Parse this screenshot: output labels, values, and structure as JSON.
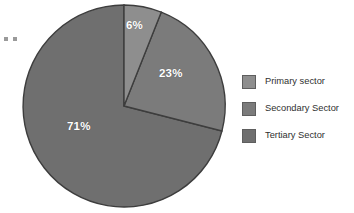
{
  "chart_data": {
    "type": "pie",
    "title": "",
    "categories": [
      "Primary sector",
      "Secondary Sector",
      "Tertiary Sector"
    ],
    "values": [
      6,
      23,
      71
    ],
    "value_unit": "%",
    "data_labels": [
      "6%",
      "23%",
      "71%"
    ],
    "colors": [
      "#8e8e8e",
      "#7b7b7b",
      "#6f6f6f"
    ],
    "slice_border_color": "#3d3d3d",
    "label_color": "#ffffff",
    "start_angle_deg": 0,
    "direction": "clockwise",
    "legend_position": "right",
    "grid": false,
    "background": "#ffffff"
  },
  "figure": {
    "background": "#ffffff",
    "center_x": 124,
    "center_y": 106,
    "radius": 101
  },
  "slices": [
    {
      "key": "primary",
      "name": "Primary sector",
      "value": 6,
      "label": "6%",
      "color": "#8e8e8e",
      "path": "M 124 106 L 124 5 A 101 101 0 0 1 161.23 12.15 Z"
    },
    {
      "key": "secondary",
      "name": "Secondary Sector",
      "value": 23,
      "label": "23%",
      "color": "#7b7b7b",
      "path": "M 124 106 L 161.23 12.15 A 101 101 0 0 1 221.93 131.02 Z"
    },
    {
      "key": "tertiary",
      "name": "Tertiary Sector",
      "value": 71,
      "label": "71%",
      "color": "#6f6f6f",
      "path": "M 124 106 L 221.93 131.02 A 101 101 0 1 1 124 5 Z"
    }
  ],
  "legend": {
    "items": [
      {
        "label": "Primary sector",
        "color": "#8e8e8e"
      },
      {
        "label": "Secondary Sector",
        "color": "#7b7b7b"
      },
      {
        "label": "Tertiary Sector",
        "color": "#6f6f6f"
      }
    ]
  },
  "marks": {
    "dot_color": "#9a9a9a"
  }
}
